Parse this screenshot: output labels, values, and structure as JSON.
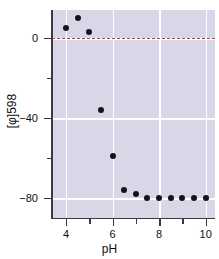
{
  "chart_data": {
    "type": "scatter",
    "title": "",
    "xlabel": "pH",
    "ylabel": "[φ]598",
    "xlim": [
      3.4,
      10.4
    ],
    "ylim": [
      -90,
      14
    ],
    "grid": true,
    "legend": null,
    "x_ticks_major": [
      4,
      6,
      8,
      10
    ],
    "x_ticks_major_labels": [
      "4",
      "6",
      "8",
      "10"
    ],
    "x_ticks_minor": [
      5,
      7,
      9
    ],
    "y_ticks_major": [
      0,
      -40,
      -80
    ],
    "y_ticks_major_labels": [
      "0",
      "−40",
      "−80"
    ],
    "y_ticks_minor": [
      -20,
      -60
    ],
    "reference_line": {
      "y": 0,
      "style": "dashed",
      "color": "#c23b48"
    },
    "panel_background": "#d7d7e8",
    "marker_color": "#141418",
    "series": [
      {
        "name": "ellipticity at 598 nm",
        "x": [
          4.0,
          4.5,
          5.0,
          5.5,
          6.0,
          6.5,
          7.0,
          7.5,
          8.0,
          8.5,
          9.0,
          9.5,
          10.0
        ],
        "y": [
          5,
          10,
          3,
          -36,
          -59,
          -76,
          -78,
          -80,
          -80,
          -80,
          -80,
          -80,
          -80
        ]
      }
    ]
  },
  "axes": {
    "y_title": "[φ]598",
    "x_title": "pH"
  }
}
